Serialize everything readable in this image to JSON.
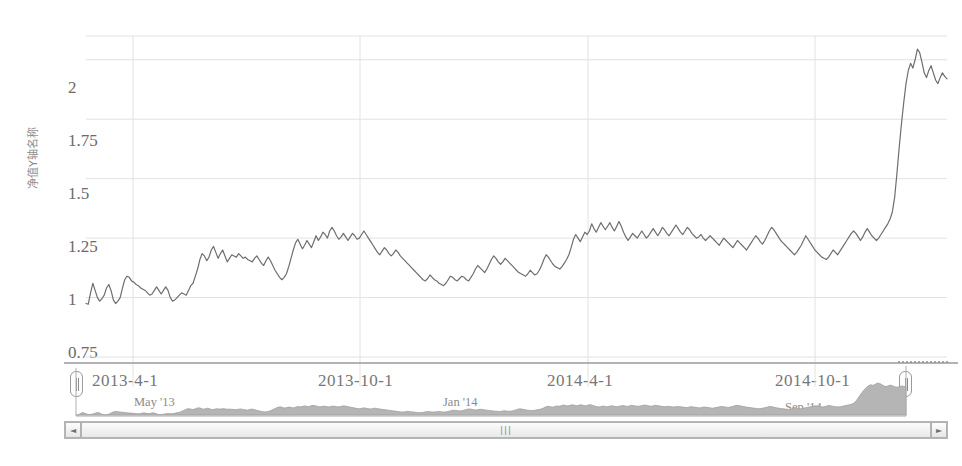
{
  "chart_data": {
    "type": "line",
    "title": "",
    "xlabel": "",
    "ylabel": "净值Y轴名称",
    "ylim": [
      0.75,
      2.1
    ],
    "yticks": [
      0.75,
      1,
      1.25,
      1.5,
      1.75,
      2
    ],
    "ytick_labels": [
      "0.75",
      "1",
      "1.25",
      "1.5",
      "1.75",
      "2"
    ],
    "xticks": [
      "2013-4-1",
      "2013-10-1",
      "2014-4-1",
      "2014-10-1"
    ],
    "grid": true,
    "legend": "none",
    "line_color": "#6e6e6e",
    "series": [
      {
        "name": "净值",
        "values": [
          0.975,
          0.972,
          1.02,
          1.06,
          1.03,
          1.0,
          0.985,
          0.995,
          1.01,
          1.04,
          1.055,
          1.03,
          0.99,
          0.975,
          0.985,
          1.0,
          1.04,
          1.075,
          1.09,
          1.085,
          1.07,
          1.065,
          1.055,
          1.05,
          1.04,
          1.035,
          1.03,
          1.02,
          1.01,
          1.015,
          1.03,
          1.045,
          1.03,
          1.015,
          1.03,
          1.045,
          1.03,
          1.0,
          0.985,
          0.99,
          1.0,
          1.01,
          1.02,
          1.015,
          1.01,
          1.03,
          1.05,
          1.06,
          1.09,
          1.12,
          1.16,
          1.185,
          1.175,
          1.155,
          1.17,
          1.2,
          1.215,
          1.19,
          1.165,
          1.185,
          1.2,
          1.175,
          1.15,
          1.165,
          1.18,
          1.175,
          1.17,
          1.185,
          1.175,
          1.165,
          1.17,
          1.16,
          1.155,
          1.15,
          1.165,
          1.175,
          1.16,
          1.145,
          1.135,
          1.155,
          1.17,
          1.155,
          1.135,
          1.115,
          1.1,
          1.085,
          1.075,
          1.085,
          1.1,
          1.13,
          1.165,
          1.2,
          1.23,
          1.245,
          1.225,
          1.205,
          1.22,
          1.24,
          1.225,
          1.21,
          1.235,
          1.26,
          1.24,
          1.255,
          1.275,
          1.265,
          1.25,
          1.28,
          1.295,
          1.28,
          1.26,
          1.245,
          1.255,
          1.27,
          1.255,
          1.24,
          1.255,
          1.27,
          1.26,
          1.245,
          1.25,
          1.265,
          1.28,
          1.265,
          1.25,
          1.235,
          1.22,
          1.205,
          1.19,
          1.18,
          1.195,
          1.21,
          1.2,
          1.185,
          1.175,
          1.185,
          1.2,
          1.19,
          1.175,
          1.165,
          1.155,
          1.145,
          1.135,
          1.125,
          1.115,
          1.105,
          1.095,
          1.085,
          1.075,
          1.07,
          1.08,
          1.095,
          1.085,
          1.075,
          1.07,
          1.06,
          1.055,
          1.05,
          1.06,
          1.075,
          1.09,
          1.085,
          1.075,
          1.07,
          1.08,
          1.09,
          1.085,
          1.075,
          1.07,
          1.085,
          1.1,
          1.12,
          1.135,
          1.125,
          1.115,
          1.105,
          1.12,
          1.14,
          1.16,
          1.175,
          1.165,
          1.15,
          1.14,
          1.15,
          1.165,
          1.155,
          1.145,
          1.135,
          1.125,
          1.115,
          1.105,
          1.1,
          1.095,
          1.09,
          1.1,
          1.115,
          1.105,
          1.095,
          1.1,
          1.115,
          1.135,
          1.16,
          1.18,
          1.17,
          1.155,
          1.14,
          1.13,
          1.125,
          1.12,
          1.13,
          1.145,
          1.16,
          1.18,
          1.21,
          1.245,
          1.265,
          1.25,
          1.235,
          1.255,
          1.275,
          1.265,
          1.28,
          1.31,
          1.29,
          1.275,
          1.295,
          1.315,
          1.3,
          1.285,
          1.3,
          1.315,
          1.295,
          1.28,
          1.3,
          1.32,
          1.3,
          1.275,
          1.255,
          1.24,
          1.255,
          1.27,
          1.26,
          1.25,
          1.265,
          1.28,
          1.265,
          1.25,
          1.26,
          1.275,
          1.29,
          1.275,
          1.26,
          1.275,
          1.295,
          1.285,
          1.27,
          1.26,
          1.275,
          1.29,
          1.305,
          1.29,
          1.275,
          1.265,
          1.28,
          1.295,
          1.285,
          1.27,
          1.26,
          1.25,
          1.255,
          1.265,
          1.25,
          1.24,
          1.25,
          1.26,
          1.25,
          1.24,
          1.23,
          1.22,
          1.235,
          1.25,
          1.24,
          1.23,
          1.22,
          1.21,
          1.225,
          1.24,
          1.23,
          1.22,
          1.21,
          1.2,
          1.215,
          1.23,
          1.245,
          1.26,
          1.25,
          1.235,
          1.225,
          1.24,
          1.26,
          1.28,
          1.295,
          1.285,
          1.27,
          1.255,
          1.24,
          1.23,
          1.22,
          1.21,
          1.2,
          1.19,
          1.18,
          1.19,
          1.205,
          1.22,
          1.24,
          1.26,
          1.245,
          1.23,
          1.215,
          1.2,
          1.19,
          1.18,
          1.17,
          1.165,
          1.16,
          1.17,
          1.185,
          1.2,
          1.19,
          1.18,
          1.195,
          1.21,
          1.225,
          1.24,
          1.255,
          1.27,
          1.28,
          1.27,
          1.255,
          1.24,
          1.255,
          1.275,
          1.29,
          1.275,
          1.26,
          1.25,
          1.24,
          1.25,
          1.265,
          1.28,
          1.295,
          1.31,
          1.33,
          1.36,
          1.42,
          1.52,
          1.63,
          1.73,
          1.82,
          1.9,
          1.955,
          1.985,
          1.965,
          2.0,
          2.045,
          2.03,
          1.99,
          1.945,
          1.925,
          1.955,
          1.975,
          1.945,
          1.915,
          1.9,
          1.925,
          1.945,
          1.93,
          1.92
        ]
      }
    ],
    "navigator": {
      "xticks": [
        "May '13",
        "Jan '14",
        "Sep '14"
      ],
      "area_color": "#b5b5b5",
      "selection_start_pct": 0,
      "selection_end_pct": 100
    }
  },
  "axis": {
    "y_title": "净值Y轴名称",
    "y_tick_labels": [
      "2",
      "1.75",
      "1.5",
      "1.25",
      "1",
      "0.75"
    ],
    "x_tick_labels": [
      "2013-4-1",
      "2013-10-1",
      "2014-4-1",
      "2014-10-1"
    ]
  },
  "navigator": {
    "tick_labels": [
      "May '13",
      "Jan '14",
      "Sep '14"
    ],
    "left_handle_name": "left-handle",
    "right_handle_name": "right-handle"
  },
  "scrollbar": {
    "left_arrow": "◄",
    "right_arrow": "►",
    "grip": "|||"
  },
  "colors": {
    "line": "#6e6e6e",
    "grid": "#e2e2e2",
    "navigator_area": "#bcbcbc",
    "axis_text": "#707070"
  }
}
